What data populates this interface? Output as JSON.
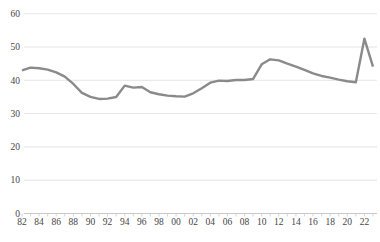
{
  "chart_data": {
    "type": "line",
    "title": "",
    "xlabel": "",
    "ylabel": "",
    "ylim": [
      0,
      60
    ],
    "grid": "horizontal",
    "legend": "none",
    "y_ticks": [
      0,
      10,
      20,
      30,
      40,
      50,
      60
    ],
    "x_tick_labels": [
      "82",
      "84",
      "86",
      "88",
      "90",
      "92",
      "94",
      "96",
      "98",
      "00",
      "02",
      "04",
      "06",
      "08",
      "10",
      "12",
      "14",
      "16",
      "18",
      "20",
      "22"
    ],
    "series": [
      {
        "name": "series-1",
        "color": "#8a8a8a",
        "years": [
          1982,
          1983,
          1984,
          1985,
          1986,
          1987,
          1988,
          1989,
          1990,
          1991,
          1992,
          1993,
          1994,
          1995,
          1996,
          1997,
          1998,
          1999,
          2000,
          2001,
          2002,
          2003,
          2004,
          2005,
          2006,
          2007,
          2008,
          2009,
          2010,
          2011,
          2012,
          2013,
          2014,
          2015,
          2016,
          2017,
          2018,
          2019,
          2020,
          2021,
          2022,
          2023
        ],
        "values": [
          43.0,
          43.8,
          43.6,
          43.2,
          42.4,
          41.1,
          38.9,
          36.2,
          35.0,
          34.4,
          34.5,
          35.0,
          38.4,
          37.8,
          38.0,
          36.4,
          35.8,
          35.4,
          35.2,
          35.1,
          36.1,
          37.6,
          39.3,
          39.9,
          39.8,
          40.1,
          40.1,
          40.4,
          44.8,
          46.3,
          46.0,
          45.0,
          44.1,
          43.1,
          42.1,
          41.3,
          40.8,
          40.2,
          39.7,
          39.4,
          52.5,
          44.1
        ]
      }
    ],
    "colors": {
      "background": "#ffffff",
      "grid": "#dcdcdc",
      "axis": "#c9c9c9",
      "tick": "#cccccc",
      "tick_label": "#454545"
    }
  }
}
